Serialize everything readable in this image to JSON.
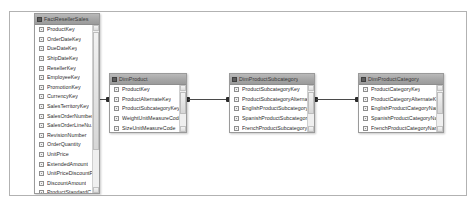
{
  "diagram": {
    "background_color": "#ffffff",
    "border_color": "#b2b2b2",
    "relationship_line_color": "#4a4a4a"
  },
  "tables": [
    {
      "name": "FactResellerSales",
      "x": 24,
      "y": 1,
      "width": 66,
      "height": 181,
      "columns": [
        "ProductKey",
        "OrderDateKey",
        "DueDateKey",
        "ShipDateKey",
        "ResellerKey",
        "EmployeeKey",
        "PromotionKey",
        "CurrencyKey",
        "SalesTerritoryKey",
        "SalesOrderNumber",
        "SalesOrderLineNu...",
        "RevisionNumber",
        "OrderQuantity",
        "UnitPrice",
        "ExtendedAmount",
        "UnitPriceDiscountP...",
        "DiscountAmount",
        "ProductStandardC..."
      ]
    },
    {
      "name": "DimProduct",
      "x": 99,
      "y": 61,
      "width": 78,
      "height": 60,
      "columns": [
        "ProductKey",
        "ProductAlternateKey",
        "ProductSubcategoryKey",
        "WeightUnitMeasureCode",
        "SizeUnitMeasureCode"
      ]
    },
    {
      "name": "DimProductSubcategory",
      "x": 219,
      "y": 61,
      "width": 86,
      "height": 60,
      "columns": [
        "ProductSubcategoryKey",
        "ProductSubcategoryAlternateKey",
        "EnglishProductSubcategoryName",
        "SpanishProductSubcategoryName",
        "FrenchProductSubcategoryName"
      ]
    },
    {
      "name": "DimProductCategory",
      "x": 348,
      "y": 61,
      "width": 86,
      "height": 60,
      "columns": [
        "ProductCategoryKey",
        "ProductCategoryAlternateKey",
        "EnglishProductCategoryName",
        "SpanishProductCategoryName",
        "FrenchProductCategoryName"
      ]
    }
  ],
  "relationships": [
    {
      "from": "FactResellerSales",
      "to": "DimProduct",
      "from_column": "ProductKey",
      "to_column": "ProductKey"
    },
    {
      "from": "DimProduct",
      "to": "DimProductSubcategory",
      "from_column": "ProductSubcategoryKey",
      "to_column": "ProductSubcategoryKey"
    },
    {
      "from": "DimProductSubcategory",
      "to": "DimProductCategory",
      "from_column": "ProductCategoryKey",
      "to_column": "ProductCategoryKey"
    }
  ]
}
